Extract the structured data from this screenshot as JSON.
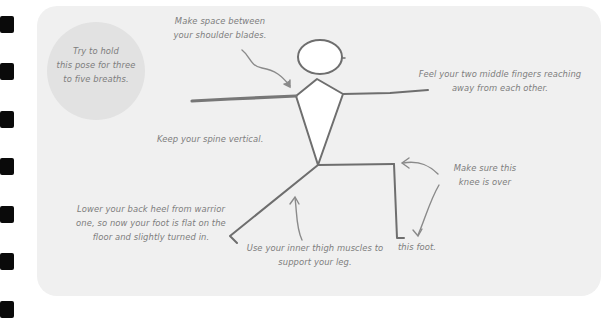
{
  "diagram": {
    "title_hint": "Warrior pose stick figure with alignment cues",
    "colors": {
      "card_background": "#f0f0f0",
      "circle_background": "#e2e2e2",
      "text": "#7d7d7d",
      "line": "#6e6e6e",
      "binder_holes": "#0a0a0a"
    },
    "breath_tip": {
      "lines": [
        "Try to hold",
        "this pose for three",
        "to five breaths."
      ]
    },
    "annotations": {
      "shoulders": {
        "lines": [
          "Make space between",
          "your shoulder blades."
        ]
      },
      "fingers": {
        "lines": [
          "Feel your two middle fingers reaching",
          "away from each other."
        ]
      },
      "spine": {
        "lines": [
          "Keep your spine vertical."
        ]
      },
      "knee": {
        "lines": [
          "Make sure this",
          "knee is over"
        ]
      },
      "foot": {
        "lines": [
          "this foot."
        ]
      },
      "back_heel": {
        "lines": [
          "Lower your back heel from warrior",
          "one, so now your foot is flat on the",
          "floor and slightly turned in."
        ]
      },
      "thigh": {
        "lines": [
          "Use your inner thigh muscles to",
          "support your leg."
        ]
      }
    }
  }
}
